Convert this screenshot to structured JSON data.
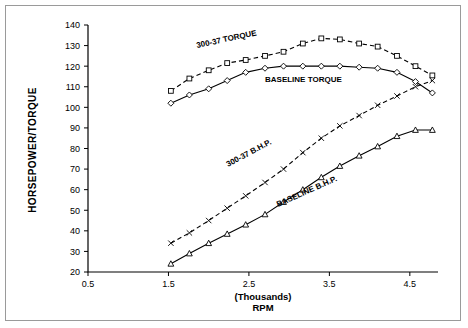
{
  "chart_data": {
    "type": "line",
    "title": "",
    "xlabel": "(Thousands) RPM",
    "xlabel_line1": "(Thousands)",
    "xlabel_line2": "RPM",
    "ylabel": "HORSEPOWER/TORQUE",
    "xlim": [
      0.5,
      4.85
    ],
    "ylim": [
      20,
      140
    ],
    "xticks": [
      0.5,
      1.5,
      2.5,
      3.5,
      4.5
    ],
    "xtick_labels": [
      "0.5",
      "1.5",
      "2.5",
      "3.5",
      "4.5"
    ],
    "yticks": [
      20,
      30,
      40,
      50,
      60,
      70,
      80,
      90,
      100,
      110,
      120,
      130,
      140
    ],
    "ytick_labels": [
      "20",
      "30",
      "40",
      "50",
      "60",
      "70",
      "80",
      "90",
      "100",
      "110",
      "120",
      "130",
      "140"
    ],
    "grid": false,
    "legend_position": "inline-annotations",
    "series": [
      {
        "name": "300-37 TORQUE",
        "marker": "square",
        "line": "dashed",
        "label_text": "300-37 TORQUE",
        "x": [
          1.53,
          1.76,
          2.0,
          2.23,
          2.46,
          2.7,
          2.93,
          3.17,
          3.4,
          3.63,
          3.87,
          4.1,
          4.34,
          4.57,
          4.78
        ],
        "y": [
          108,
          114,
          118,
          121.5,
          123,
          125,
          127,
          131,
          133.5,
          133,
          131,
          129.5,
          125,
          120,
          115.5
        ]
      },
      {
        "name": "BASELINE TORQUE",
        "marker": "diamond",
        "line": "solid",
        "label_text": "BASELINE TORQUE",
        "x": [
          1.53,
          1.76,
          2.0,
          2.23,
          2.46,
          2.7,
          2.93,
          3.17,
          3.4,
          3.63,
          3.87,
          4.1,
          4.34,
          4.57,
          4.78
        ],
        "y": [
          102,
          106,
          109,
          113,
          117,
          119,
          120,
          120,
          120,
          120,
          119.5,
          119,
          117,
          112.5,
          107
        ]
      },
      {
        "name": "300-37 B.H.P.",
        "marker": "x",
        "line": "dashed",
        "label_text": "300-37  B.H.P.",
        "x": [
          1.53,
          1.76,
          2.0,
          2.23,
          2.46,
          2.7,
          2.93,
          3.17,
          3.4,
          3.63,
          3.87,
          4.1,
          4.34,
          4.57,
          4.78
        ],
        "y": [
          34,
          39,
          45,
          51,
          57,
          63.5,
          70,
          78,
          85,
          91,
          96,
          101,
          105.5,
          110,
          113
        ]
      },
      {
        "name": "BASELINE B.H.P.",
        "marker": "triangle",
        "line": "solid",
        "label_text": "BASELINE B.H.P.",
        "x": [
          1.53,
          1.76,
          2.0,
          2.23,
          2.46,
          2.7,
          2.93,
          3.17,
          3.4,
          3.63,
          3.87,
          4.1,
          4.34,
          4.57,
          4.78
        ],
        "y": [
          24,
          29,
          34,
          38.5,
          43,
          48,
          54,
          60,
          66,
          71.5,
          76.5,
          81,
          86,
          89,
          89
        ]
      }
    ]
  },
  "colors": {
    "frame": "#9a9a9a",
    "axis": "#000000",
    "curve": "#000000",
    "background": "#ffffff"
  }
}
